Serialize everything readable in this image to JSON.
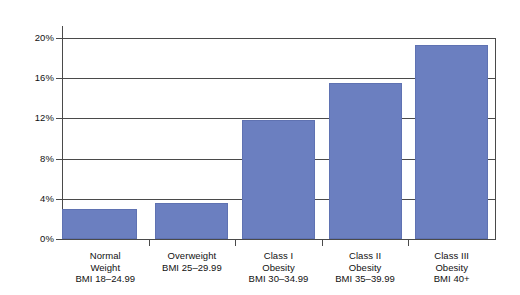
{
  "chart_data": {
    "type": "bar",
    "title": "",
    "subtitle": "",
    "xlabel": "",
    "ylabel": "",
    "categories": [
      "Normal Weight BMI 18–24.99",
      "Overweight BMI 25–29.99",
      "Class I Obesity BMI 30–34.99",
      "Class II Obesity BMI 35–39.99",
      "Class III Obesity BMI 40+"
    ],
    "category_lines": [
      [
        "Normal",
        "Weight",
        "BMI 18–24.99"
      ],
      [
        "Overweight",
        "BMI 25–29.99"
      ],
      [
        "Class I",
        "Obesity",
        "BMI 30–34.99"
      ],
      [
        "Class II",
        "Obesity",
        "BMI 35–39.99"
      ],
      [
        "Class III",
        "Obesity",
        "BMI 40+"
      ]
    ],
    "values": [
      3.0,
      3.6,
      11.8,
      15.5,
      19.3
    ],
    "ylim": [
      0,
      20
    ],
    "ytick_values": [
      0,
      4,
      8,
      12,
      16,
      20
    ],
    "ytick_labels": [
      "0%",
      "4%",
      "8%",
      "12%",
      "16%",
      "20%"
    ],
    "grid": true,
    "grid_axis": "y",
    "legend": false,
    "legend_position": "none",
    "bar_color": "#6B7FC0",
    "bar_edge_color": "#5F72B2",
    "axis_color": "#4A4A4A",
    "text_color": "#111111",
    "background_color": "#FFFFFF"
  }
}
